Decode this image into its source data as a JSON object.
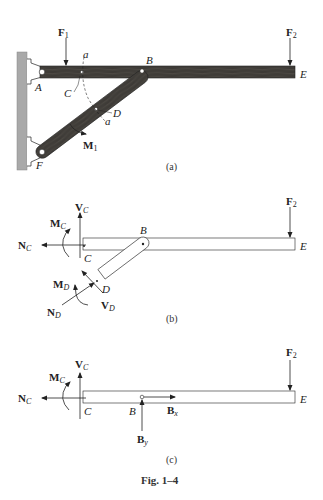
{
  "figure": {
    "caption": "Fig. 1–4",
    "colors": {
      "wood": "#3d3a36",
      "wood_grain": "#5a5650",
      "wall": "#a9a9a9",
      "line": "#222222",
      "outline_fill": "#ffffff"
    }
  },
  "panel_a": {
    "caption": "(a)",
    "points": {
      "A": "A",
      "B": "B",
      "C": "C",
      "D": "D",
      "E": "E",
      "F": "F"
    },
    "section": {
      "a_top": "a",
      "a_bottom": "a"
    },
    "forces": {
      "F1": {
        "base": "F",
        "sub": "1"
      },
      "F2": {
        "base": "F",
        "sub": "2"
      },
      "M1": {
        "base": "M",
        "sub": "1"
      }
    }
  },
  "panel_b": {
    "caption": "(b)",
    "points": {
      "B": "B",
      "C": "C",
      "D": "D",
      "E": "E"
    },
    "forces": {
      "NC": {
        "base": "N",
        "sub": "C"
      },
      "VC": {
        "base": "V",
        "sub": "C"
      },
      "MC": {
        "base": "M",
        "sub": "C"
      },
      "ND": {
        "base": "N",
        "sub": "D"
      },
      "VD": {
        "base": "V",
        "sub": "D"
      },
      "MD": {
        "base": "M",
        "sub": "D"
      },
      "F2": {
        "base": "F",
        "sub": "2"
      }
    }
  },
  "panel_c": {
    "caption": "(c)",
    "points": {
      "B": "B",
      "C": "C",
      "E": "E"
    },
    "forces": {
      "NC": {
        "base": "N",
        "sub": "C"
      },
      "VC": {
        "base": "V",
        "sub": "C"
      },
      "MC": {
        "base": "M",
        "sub": "C"
      },
      "Bx": {
        "base": "B",
        "sub": "x"
      },
      "By": {
        "base": "B",
        "sub": "y"
      },
      "F2": {
        "base": "F",
        "sub": "2"
      }
    }
  }
}
